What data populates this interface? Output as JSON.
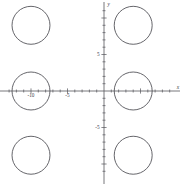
{
  "chart_data": {
    "type": "scatter",
    "title": "",
    "xlabel": "x",
    "ylabel": "y",
    "grid": false,
    "legend": null,
    "xlim": [
      -13.8,
      10.5
    ],
    "ylim": [
      -12.2,
      12.0
    ],
    "origin_px": [
      104,
      91
    ],
    "pixels_per_unit": 7.3,
    "axis_labels": {
      "x_axis_name": "x",
      "y_axis_name": "y"
    },
    "x_tick_labels": [
      {
        "value": -10,
        "text": "-10"
      },
      {
        "value": -5,
        "text": "-5"
      }
    ],
    "y_tick_labels": [
      {
        "value": 5,
        "text": "5"
      },
      {
        "value": -5,
        "text": "-5"
      }
    ],
    "x_tick_values": [
      -13,
      -12,
      -11,
      -10,
      -9,
      -8,
      -7,
      -6,
      -5,
      -4,
      -3,
      -2,
      -1,
      1,
      2,
      3,
      4,
      5,
      6,
      7,
      8,
      9
    ],
    "y_tick_values": [
      -11,
      -10,
      -9,
      -8,
      -7,
      -6,
      -5,
      -4,
      -3,
      -2,
      -1,
      1,
      2,
      3,
      4,
      5,
      6,
      7,
      8,
      9,
      10,
      11
    ],
    "shapes": [
      {
        "name": "circle-top-left",
        "type": "circle",
        "cx": -10,
        "cy": 9,
        "r": 2.6
      },
      {
        "name": "circle-top-right",
        "type": "circle",
        "cx": 4,
        "cy": 9,
        "r": 2.6
      },
      {
        "name": "circle-middle-left",
        "type": "circle",
        "cx": -10,
        "cy": 0,
        "r": 2.6
      },
      {
        "name": "circle-middle-right",
        "type": "circle",
        "cx": 4,
        "cy": 0,
        "r": 2.6
      },
      {
        "name": "circle-bottom-left",
        "type": "circle",
        "cx": -10,
        "cy": -8.8,
        "r": 2.6
      },
      {
        "name": "circle-bottom-right",
        "type": "circle",
        "cx": 4,
        "cy": -8.8,
        "r": 2.6
      }
    ]
  },
  "colors": {
    "background": "#ffffff",
    "axis": "#55555a",
    "curve": "#4a4a50",
    "label": "#3a3a3f"
  }
}
